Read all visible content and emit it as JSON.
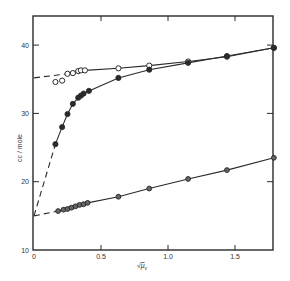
{
  "chart_data": {
    "type": "scatter",
    "title": "",
    "xlabel": "√μv",
    "ylabel": "cc / mole",
    "xlim": [
      0,
      1.8
    ],
    "ylim": [
      10,
      44
    ],
    "xticks": [
      0,
      0.5,
      1.0,
      1.5
    ],
    "xtick_labels": [
      "0",
      "0.5",
      "1.0",
      "1.5"
    ],
    "yticks": [
      10,
      20,
      30,
      40
    ],
    "ytick_labels": [
      "10",
      "20",
      "30",
      "40"
    ],
    "grid": false,
    "legend": null,
    "series": [
      {
        "name": "upper open circles",
        "marker": "open-circle",
        "line": "solid",
        "points": [
          [
            0.16,
            34.6
          ],
          [
            0.21,
            34.8
          ],
          [
            0.25,
            35.8
          ],
          [
            0.29,
            35.9
          ],
          [
            0.33,
            36.2
          ],
          [
            0.35,
            36.3
          ],
          [
            0.38,
            36.3
          ],
          [
            0.63,
            36.6
          ],
          [
            0.86,
            37.0
          ],
          [
            1.15,
            37.6
          ],
          [
            1.44,
            38.3
          ],
          [
            1.79,
            39.6
          ]
        ]
      },
      {
        "name": "filled circles (curved)",
        "marker": "filled-circle",
        "line": "solid",
        "points": [
          [
            0.16,
            25.5
          ],
          [
            0.21,
            28.0
          ],
          [
            0.25,
            29.9
          ],
          [
            0.29,
            31.4
          ],
          [
            0.33,
            32.3
          ],
          [
            0.35,
            32.6
          ],
          [
            0.37,
            32.9
          ],
          [
            0.41,
            33.3
          ],
          [
            0.63,
            35.2
          ],
          [
            0.86,
            36.4
          ],
          [
            1.15,
            37.4
          ],
          [
            1.44,
            38.4
          ],
          [
            1.79,
            39.6
          ]
        ]
      },
      {
        "name": "lower line circles",
        "marker": "half-filled-circle",
        "line": "solid",
        "points": [
          [
            0.18,
            15.7
          ],
          [
            0.22,
            15.9
          ],
          [
            0.25,
            16.0
          ],
          [
            0.28,
            16.2
          ],
          [
            0.31,
            16.4
          ],
          [
            0.34,
            16.6
          ],
          [
            0.37,
            16.7
          ],
          [
            0.4,
            16.9
          ],
          [
            0.63,
            17.8
          ],
          [
            0.86,
            19.0
          ],
          [
            1.15,
            20.4
          ],
          [
            1.44,
            21.7
          ],
          [
            1.79,
            23.5
          ]
        ]
      }
    ],
    "extrapolations": [
      {
        "name": "upper dashed extrapolation",
        "from": [
          0,
          35.2
        ],
        "to": [
          0.25,
          35.8
        ]
      },
      {
        "name": "steep dashed extrapolation",
        "from": [
          0,
          15.0
        ],
        "to": [
          0.16,
          25.5
        ]
      },
      {
        "name": "lower dashed extrapolation",
        "from": [
          0,
          15.0
        ],
        "to": [
          0.18,
          15.7
        ]
      }
    ]
  }
}
